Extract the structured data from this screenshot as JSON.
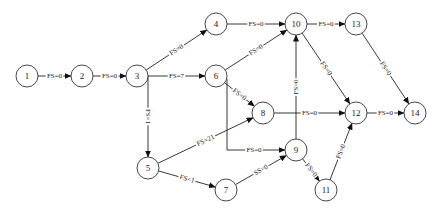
{
  "diagram": {
    "type": "precedence-network",
    "nodes": [
      {
        "id": "1",
        "label": "1"
      },
      {
        "id": "2",
        "label": "2"
      },
      {
        "id": "3",
        "label": "3"
      },
      {
        "id": "4",
        "label": "4"
      },
      {
        "id": "5",
        "label": "5"
      },
      {
        "id": "6",
        "label": "6"
      },
      {
        "id": "7",
        "label": "7"
      },
      {
        "id": "8",
        "label": "8"
      },
      {
        "id": "9",
        "label": "9"
      },
      {
        "id": "10",
        "label": "10"
      },
      {
        "id": "11",
        "label": "11"
      },
      {
        "id": "12",
        "label": "12"
      },
      {
        "id": "13",
        "label": "13"
      },
      {
        "id": "14",
        "label": "14"
      }
    ],
    "edges": [
      {
        "from": "1",
        "to": "2",
        "label": "FS=0"
      },
      {
        "from": "2",
        "to": "3",
        "label": "FS=0"
      },
      {
        "from": "3",
        "to": "4",
        "label": "FS=0"
      },
      {
        "from": "3",
        "to": "6",
        "label": "FS=7"
      },
      {
        "from": "3",
        "to": "5",
        "label": "FS=1"
      },
      {
        "from": "4",
        "to": "10",
        "label": "FS=0"
      },
      {
        "from": "6",
        "to": "10",
        "label": "FS=0"
      },
      {
        "from": "6",
        "to": "8",
        "label": "FS=0"
      },
      {
        "from": "6",
        "to": "9",
        "label": "FS=0"
      },
      {
        "from": "5",
        "to": "8",
        "label": "FS=21"
      },
      {
        "from": "5",
        "to": "7",
        "label": "FS=1"
      },
      {
        "from": "7",
        "to": "9",
        "label": "SS=0"
      },
      {
        "from": "9",
        "to": "10",
        "label": "FS=0"
      },
      {
        "from": "9",
        "to": "11",
        "label": "FS=0"
      },
      {
        "from": "8",
        "to": "12",
        "label": "FS=0"
      },
      {
        "from": "10",
        "to": "12",
        "label": "FS=0"
      },
      {
        "from": "10",
        "to": "13",
        "label": "FS=0"
      },
      {
        "from": "13",
        "to": "14",
        "label": "FS=0"
      },
      {
        "from": "11",
        "to": "12",
        "label": "FS=0"
      },
      {
        "from": "12",
        "to": "14",
        "label": "FS=0"
      }
    ]
  }
}
